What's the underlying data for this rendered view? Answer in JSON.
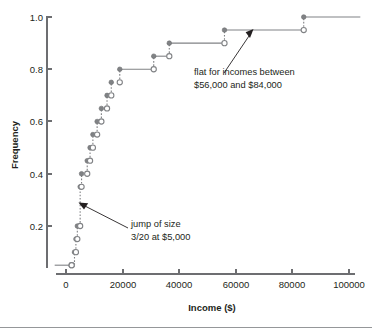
{
  "chart_data": {
    "type": "line",
    "title": "",
    "subtitle": "",
    "xlabel": "Income ($)",
    "ylabel": "Frequency",
    "xlim": [
      -4000,
      104000
    ],
    "ylim": [
      0.0,
      1.02
    ],
    "grid": false,
    "legend": "none",
    "xticks": [
      0,
      20000,
      40000,
      60000,
      80000,
      100000
    ],
    "xtick_labels": [
      "0",
      "20000",
      "40000",
      "60000",
      "80000",
      "100000"
    ],
    "yticks": [
      0.2,
      0.4,
      0.6,
      0.8,
      1.0
    ],
    "ytick_labels": [
      "0.2",
      "0.4",
      "0.6",
      "0.8",
      "1.0"
    ],
    "step_points": [
      {
        "x": 2000,
        "y": 0.05
      },
      {
        "x": 3000,
        "y": 0.1
      },
      {
        "x": 3500,
        "y": 0.15
      },
      {
        "x": 4000,
        "y": 0.2
      },
      {
        "x": 5000,
        "y": 0.35
      },
      {
        "x": 5500,
        "y": 0.4
      },
      {
        "x": 7500,
        "y": 0.45
      },
      {
        "x": 8500,
        "y": 0.5
      },
      {
        "x": 9500,
        "y": 0.55
      },
      {
        "x": 11000,
        "y": 0.6
      },
      {
        "x": 12500,
        "y": 0.65
      },
      {
        "x": 14500,
        "y": 0.7
      },
      {
        "x": 16000,
        "y": 0.75
      },
      {
        "x": 19000,
        "y": 0.8
      },
      {
        "x": 31000,
        "y": 0.85
      },
      {
        "x": 36500,
        "y": 0.9
      },
      {
        "x": 56000,
        "y": 0.95
      },
      {
        "x": 84000,
        "y": 1.0
      }
    ],
    "segments": [
      {
        "y": 0.05,
        "x_from": -4000,
        "x_to": 2000
      },
      {
        "y": 0.8,
        "x_from": 19000,
        "x_to": 31000
      },
      {
        "y": 0.85,
        "x_from": 31000,
        "x_to": 36500
      },
      {
        "y": 0.9,
        "x_from": 36500,
        "x_to": 56000
      },
      {
        "y": 0.95,
        "x_from": 56000,
        "x_to": 84000
      },
      {
        "y": 1.0,
        "x_from": 84000,
        "x_to": 104000
      }
    ],
    "annotations": [
      {
        "id": "jump-annotation",
        "line1": "jump of size",
        "line2": "3/20 at $5,000",
        "points_to_x": 5000,
        "points_to_y": 0.27
      },
      {
        "id": "flat-annotation",
        "line1": "flat for incomes between",
        "line2": "$56,000 and $84,000",
        "points_to_x": 64000,
        "points_to_y": 0.95
      }
    ],
    "colors": {
      "line": "#808285",
      "marker_closed": "#808285",
      "marker_open_fill": "#ffffff",
      "axis": "#6d6e71",
      "text": "#231f20",
      "background": "#ffffff"
    }
  }
}
